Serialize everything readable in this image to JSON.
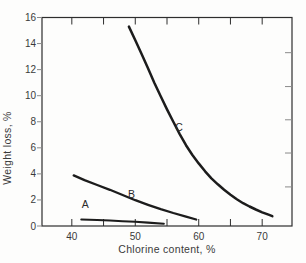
{
  "figure": {
    "kind": "scanned-book-line-plot",
    "background": "#fdfdfc"
  },
  "chart_data": {
    "type": "line",
    "title": "",
    "xlabel": "Chlorine content, %",
    "ylabel": "Weight loss, %",
    "xlim": [
      35.3,
      74.7
    ],
    "ylim": [
      0,
      16
    ],
    "grid": false,
    "legend_position": "none",
    "x_ticks": [
      40,
      45,
      50,
      55,
      60,
      65,
      70
    ],
    "x_labeled_ticks": [
      40,
      50,
      60,
      70
    ],
    "y_ticks": [
      0,
      2,
      4,
      6,
      8,
      10,
      12,
      14,
      16
    ],
    "right_edge_ticks": [
      3.0,
      5.6,
      8.15,
      10.7,
      13.3
    ],
    "colors": {
      "axis": "#2e2e2e",
      "line": "#1c1c1c",
      "text": "#3a3a3a"
    },
    "series": [
      {
        "name": "A",
        "label": "A",
        "label_at": [
          42.1,
          1.35
        ],
        "stroke_width": 2.1,
        "points": [
          [
            41.5,
            0.5
          ],
          [
            44,
            0.46
          ],
          [
            46,
            0.42
          ],
          [
            48,
            0.37
          ],
          [
            50,
            0.32
          ],
          [
            52,
            0.26
          ],
          [
            54.5,
            0.18
          ]
        ]
      },
      {
        "name": "B",
        "label": "B",
        "label_at": [
          49.4,
          2.15
        ],
        "stroke_width": 2.3,
        "points": [
          [
            40.3,
            3.88
          ],
          [
            42,
            3.52
          ],
          [
            44,
            3.15
          ],
          [
            46,
            2.78
          ],
          [
            48,
            2.38
          ],
          [
            50,
            1.98
          ],
          [
            52,
            1.63
          ],
          [
            54,
            1.3
          ],
          [
            56,
            1.0
          ],
          [
            58,
            0.72
          ],
          [
            59.6,
            0.5
          ]
        ]
      },
      {
        "name": "C",
        "label": "C",
        "label_at": [
          56.9,
          7.3
        ],
        "stroke_width": 2.5,
        "points": [
          [
            49,
            15.3
          ],
          [
            50,
            14.25
          ],
          [
            51,
            13.2
          ],
          [
            52,
            12.1
          ],
          [
            53,
            11.0
          ],
          [
            54,
            9.95
          ],
          [
            55,
            8.95
          ],
          [
            56,
            8.0
          ],
          [
            57,
            7.05
          ],
          [
            58,
            6.2
          ],
          [
            59,
            5.45
          ],
          [
            60,
            4.8
          ],
          [
            61,
            4.2
          ],
          [
            62,
            3.65
          ],
          [
            63,
            3.2
          ],
          [
            64,
            2.78
          ],
          [
            65,
            2.4
          ],
          [
            66,
            2.05
          ],
          [
            67,
            1.75
          ],
          [
            68,
            1.5
          ],
          [
            69,
            1.27
          ],
          [
            70,
            1.05
          ],
          [
            71,
            0.87
          ],
          [
            71.6,
            0.75
          ]
        ]
      }
    ]
  }
}
